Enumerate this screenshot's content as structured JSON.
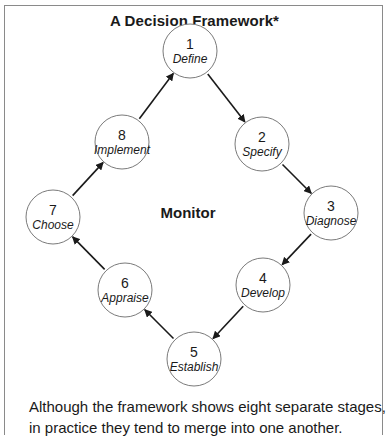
{
  "title": "A Decision Framework*",
  "center_label": "Monitor",
  "stages": [
    {
      "number": "1",
      "label": "Define",
      "cx": 190,
      "cy": 51
    },
    {
      "number": "2",
      "label": "Specify",
      "cx": 262,
      "cy": 144
    },
    {
      "number": "3",
      "label": "Diagnose",
      "cx": 331,
      "cy": 213
    },
    {
      "number": "4",
      "label": "Develop",
      "cx": 263,
      "cy": 285
    },
    {
      "number": "5",
      "label": "Establish",
      "cx": 194,
      "cy": 359
    },
    {
      "number": "6",
      "label": "Appraise",
      "cx": 125,
      "cy": 290
    },
    {
      "number": "7",
      "label": "Choose",
      "cx": 53,
      "cy": 217
    },
    {
      "number": "8",
      "label": "Implement",
      "cx": 122,
      "cy": 142
    }
  ],
  "flow": [
    "1→2",
    "2→3",
    "3→4",
    "4→5",
    "5→6",
    "6→7",
    "7→8",
    "8→1"
  ],
  "caption": {
    "line1": "Although the framework shows eight separate stages,",
    "line2": "in practice they tend to merge into one another."
  },
  "colors": {
    "circle_stroke": "#7a7a7a",
    "arrow": "#1a1a1a",
    "frame": "#8a8a8a"
  }
}
